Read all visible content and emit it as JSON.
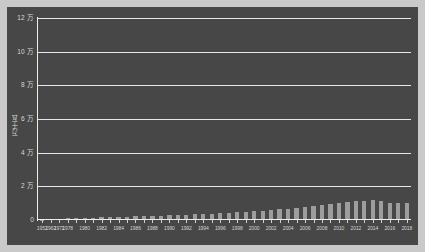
{
  "chart_data": {
    "type": "bar",
    "title": "",
    "subtitle": "",
    "xlabel": "",
    "ylabel": "万千瓦",
    "ylim": [
      0,
      120000
    ],
    "ytick_values": [
      0,
      20000,
      40000,
      60000,
      80000,
      100000,
      120000
    ],
    "ytick_labels": [
      "0",
      "2 万",
      "4 万",
      "6 万",
      "8 万",
      "10 万",
      "12 万"
    ],
    "grid": true,
    "legend": null,
    "unit_suffix": "万",
    "axis_label_color": "#d4d4d4",
    "bar_color": "#9d9d9d",
    "grid_color": "#e6e6e6",
    "panel_color": "#474747",
    "page_color": "#c9c9c9",
    "categories": [
      "1952",
      "1962",
      "1972",
      "1978",
      "1979",
      "1980",
      "1981",
      "1982",
      "1983",
      "1984",
      "1985",
      "1986",
      "1987",
      "1988",
      "1989",
      "1990",
      "1991",
      "1992",
      "1993",
      "1994",
      "1995",
      "1996",
      "1997",
      "1998",
      "1999",
      "2000",
      "2001",
      "2002",
      "2003",
      "2004",
      "2005",
      "2006",
      "2007",
      "2008",
      "2009",
      "2010",
      "2011",
      "2012",
      "2013",
      "2014",
      "2015",
      "2016",
      "2017",
      "2018"
    ],
    "values": [
      200,
      400,
      700,
      1100,
      1200,
      1300,
      1400,
      1500,
      1600,
      1800,
      2000,
      2100,
      2300,
      2500,
      2600,
      2800,
      2900,
      3100,
      3300,
      3500,
      3700,
      3900,
      4200,
      4500,
      4800,
      5100,
      5500,
      5900,
      6300,
      6600,
      7000,
      7500,
      8200,
      8800,
      9400,
      10000,
      10600,
      11200,
      11400,
      11600,
      11000,
      10000,
      10000,
      10000
    ],
    "xtick_labels": [
      "1952",
      "1962",
      "1972",
      "1978",
      "1980",
      "1982",
      "1984",
      "1986",
      "1988",
      "1990",
      "1992",
      "1994",
      "1996",
      "1998",
      "2000",
      "2002",
      "2004",
      "2006",
      "2008",
      "2010",
      "2012",
      "2014",
      "2016",
      "2018"
    ],
    "xtick_categories": [
      "1952",
      "1962",
      "1972",
      "1978",
      "1980",
      "1982",
      "1984",
      "1986",
      "1988",
      "1990",
      "1992",
      "1994",
      "1996",
      "1998",
      "2000",
      "2002",
      "2004",
      "2006",
      "2008",
      "2010",
      "2012",
      "2014",
      "2016",
      "2018"
    ]
  }
}
